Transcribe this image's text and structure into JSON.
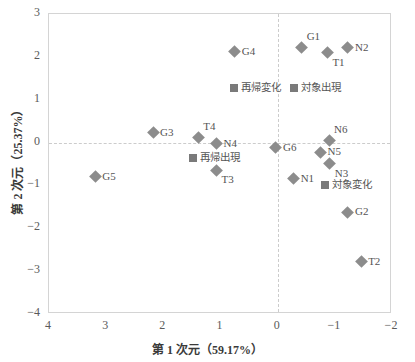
{
  "chart_data": {
    "type": "scatter",
    "title": "",
    "xlabel": "第 1 次元（59.17%）",
    "ylabel": "第 2 次元（25.37%）",
    "xlim": [
      4,
      -2
    ],
    "ylim": [
      -4,
      3
    ],
    "x_reversed": true,
    "xticks": [
      "4",
      "3",
      "2",
      "1",
      "0",
      "-1",
      "-2"
    ],
    "xtick_values": [
      4,
      3,
      2,
      1,
      0,
      -1,
      -2
    ],
    "yticks": [
      "3",
      "2",
      "1",
      "0",
      "-1",
      "-2",
      "-3",
      "-4"
    ],
    "ytick_values": [
      3,
      2,
      1,
      0,
      -1,
      -2,
      -3,
      -4
    ],
    "grid": "zero-lines-dashed",
    "legend": "none",
    "series": [
      {
        "name": "個体・転移点",
        "marker": "diamond",
        "color": "#8c8c8c",
        "points": [
          {
            "label": "G4",
            "x": 0.75,
            "y": 2.12,
            "pos": "r"
          },
          {
            "label": "G1",
            "x": -0.42,
            "y": 2.22,
            "pos": "tr"
          },
          {
            "label": "T1",
            "x": -0.87,
            "y": 2.1,
            "pos": "br"
          },
          {
            "label": "N2",
            "x": -1.23,
            "y": 2.21,
            "pos": "r"
          },
          {
            "label": "G3",
            "x": 2.18,
            "y": 0.23,
            "pos": "r"
          },
          {
            "label": "T4",
            "x": 1.39,
            "y": 0.12,
            "pos": "tr"
          },
          {
            "label": "N4",
            "x": 1.07,
            "y": -0.03,
            "pos": "r"
          },
          {
            "label": "T3",
            "x": 1.07,
            "y": -0.65,
            "pos": "br"
          },
          {
            "label": "G6",
            "x": 0.03,
            "y": -0.12,
            "pos": "r"
          },
          {
            "label": "N6",
            "x": -0.9,
            "y": 0.05,
            "pos": "tr"
          },
          {
            "label": "N5",
            "x": -0.75,
            "y": -0.23,
            "pos": "r"
          },
          {
            "label": "N3",
            "x": -0.91,
            "y": -0.49,
            "pos": "br"
          },
          {
            "label": "N1",
            "x": -0.28,
            "y": -0.84,
            "pos": "r"
          },
          {
            "label": "G5",
            "x": 3.19,
            "y": -0.8,
            "pos": "r"
          },
          {
            "label": "G2",
            "x": -1.23,
            "y": -1.62,
            "pos": "r"
          },
          {
            "label": "T2",
            "x": -1.46,
            "y": -2.78,
            "pos": "r"
          }
        ]
      },
      {
        "name": "カテゴリ",
        "marker": "square",
        "color": "#7a7a7a",
        "points": [
          {
            "label": "再帰変化",
            "x": 0.76,
            "y": 1.27,
            "pos": "r"
          },
          {
            "label": "対象出現",
            "x": -0.29,
            "y": 1.27,
            "pos": "r"
          },
          {
            "label": "再帰出現",
            "x": 1.48,
            "y": -0.35,
            "pos": "r"
          },
          {
            "label": "対象変化",
            "x": -0.83,
            "y": -1.0,
            "pos": "r"
          }
        ]
      }
    ]
  }
}
